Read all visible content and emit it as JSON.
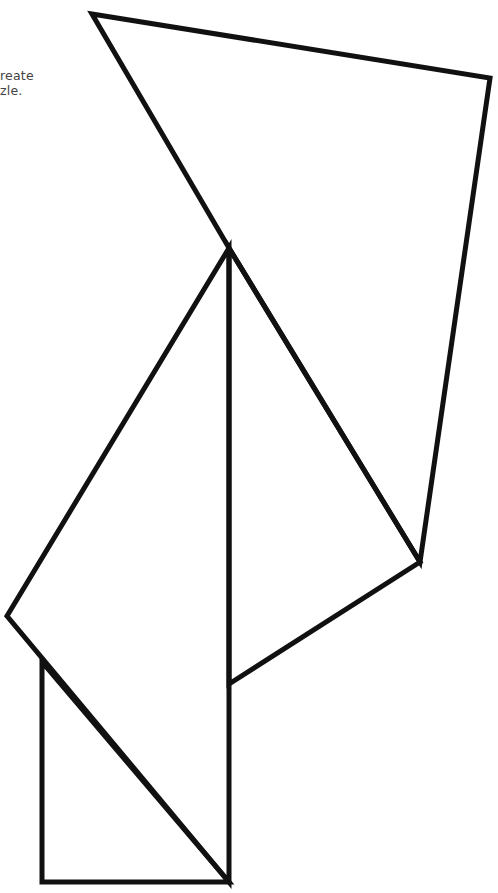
{
  "caption": {
    "line1": "reate",
    "line2": "zle."
  },
  "figure": {
    "stroke_color": "#111111",
    "stroke_width": 5,
    "background": "#ffffff",
    "shapes": [
      {
        "name": "top-kite",
        "points": "92,14 490,78 420,562 229,248"
      },
      {
        "name": "right-triangle",
        "points": "229,248 420,562 229,684"
      },
      {
        "name": "left-triangle",
        "points": "229,248 7,616 229,882"
      },
      {
        "name": "bottom-left-triangle",
        "points": "42,662 42,882 229,882"
      }
    ]
  }
}
